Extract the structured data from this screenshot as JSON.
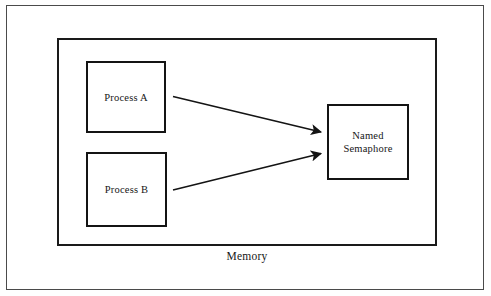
{
  "diagram": {
    "container": {
      "label": "Memory",
      "name": "memory-enclosure"
    },
    "nodes": [
      {
        "id": "process-a",
        "label": "Process A",
        "shape": "rectangle"
      },
      {
        "id": "process-b",
        "label": "Process B",
        "shape": "rectangle"
      },
      {
        "id": "named-semaphore",
        "label": "Named\nSemaphore",
        "shape": "rectangle"
      }
    ],
    "edges": [
      {
        "id": "edge-a-to-semaphore",
        "from": "process-a",
        "to": "named-semaphore",
        "arrowhead": "filled-triangle",
        "label": ""
      },
      {
        "id": "edge-b-to-semaphore",
        "from": "process-b",
        "to": "named-semaphore",
        "arrowhead": "filled-triangle",
        "label": ""
      }
    ],
    "colors": {
      "stroke": "#141414",
      "outer_frame": "#4a4a4a",
      "background": "#ffffff",
      "text": "#161616"
    }
  }
}
